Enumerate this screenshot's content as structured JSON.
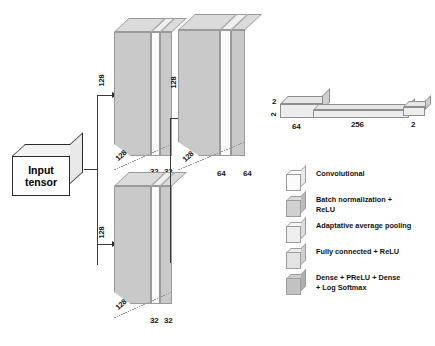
{
  "diagram": {
    "input": {
      "line1": "Input",
      "line2": "tensor",
      "name": "Input tensor"
    }
  },
  "blocks": {
    "branch_top": {
      "channels": "128",
      "depth": "128",
      "spatial_w": "32",
      "spatial_h": "32"
    },
    "branch_bottom": {
      "channels": "128",
      "depth": "128",
      "spatial_w": "32",
      "spatial_h": "32"
    },
    "merged": {
      "channels": "128",
      "depth": "128",
      "spatial_w": "64",
      "spatial_h": "64"
    }
  },
  "fc": {
    "first": {
      "height": "2",
      "side": "2",
      "width": "64"
    },
    "middle": {
      "width": "256"
    },
    "last": {
      "width": "2"
    }
  },
  "legend": {
    "items": [
      {
        "label": "Convolutional",
        "color": "#fbfbfb"
      },
      {
        "label": "Batch normalization +\nReLU",
        "color": "#d0d0d0"
      },
      {
        "label": "Adaptative average pooling",
        "color": "#efefef"
      },
      {
        "label": "Fully connected + ReLU",
        "color": "#e4e4e4"
      },
      {
        "label": "Dense + PReLU + Dense\n+ Log Softmax",
        "color": "#c2c2c2"
      }
    ]
  },
  "colors": {
    "slab_front": "#c9c9c9",
    "slab_top": "#dcdcdc",
    "slab_white": "#fafafa",
    "outline": "#9a9a9a",
    "wire": "#3a3a3a",
    "text": "#111111"
  }
}
